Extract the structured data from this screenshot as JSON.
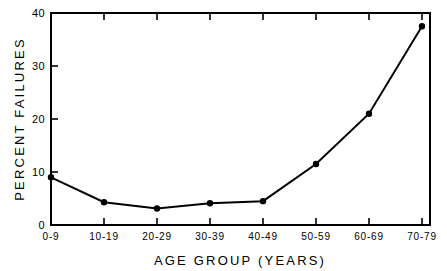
{
  "chart_data": {
    "type": "line",
    "title": "",
    "xlabel": "AGE GROUP (YEARS)",
    "ylabel": "PERCENT FAILURES",
    "categories": [
      "0-9",
      "10-19",
      "20-29",
      "30-39",
      "40-49",
      "50-59",
      "60-69",
      "70-79"
    ],
    "values": [
      9,
      4.3,
      3.1,
      4.1,
      4.5,
      11.5,
      21,
      37.5
    ],
    "series": [
      {
        "name": "Percent Failures",
        "values": [
          9,
          4.3,
          3.1,
          4.1,
          4.5,
          11.5,
          21,
          37.5
        ]
      }
    ],
    "ylim": [
      0,
      40
    ],
    "yticks": [
      0,
      10,
      20,
      30,
      40
    ],
    "ytick_labels": [
      "0",
      "10",
      "20",
      "30",
      "40"
    ],
    "xtick_labels": [
      "0-9",
      "10-19",
      "20-29",
      "30-39",
      "40-49",
      "50-59",
      "60-69",
      "70-79"
    ],
    "grid": false,
    "legend": false,
    "legend_position": "none",
    "marker": "filled-circle",
    "line_color": "#000000",
    "marker_color": "#000000",
    "background_color": "#ffffff"
  },
  "axes": {
    "y_title": "PERCENT FAILURES",
    "x_title": "AGE GROUP (YEARS)",
    "y_tick_0": "0",
    "y_tick_1": "10",
    "y_tick_2": "20",
    "y_tick_3": "30",
    "y_tick_4": "40",
    "x_tick_0": "0-9",
    "x_tick_1": "10-19",
    "x_tick_2": "20-29",
    "x_tick_3": "30-39",
    "x_tick_4": "40-49",
    "x_tick_5": "50-59",
    "x_tick_6": "60-69",
    "x_tick_7": "70-79"
  }
}
